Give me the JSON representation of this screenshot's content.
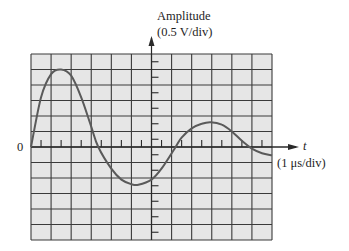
{
  "chart_data": {
    "type": "line",
    "title": "",
    "ylabel": "Amplitude",
    "ylabel_units": "(0.5 V/div)",
    "xlabel": "t",
    "xlabel_units": "(1 μs/div)",
    "origin_label": "0",
    "grid": true,
    "grid_divisions": {
      "x": 12,
      "y": 12
    },
    "x_per_div_us": 1,
    "y_per_div_V": 0.5,
    "xlim_us": [
      0,
      12
    ],
    "ylim_V": [
      -3,
      3
    ],
    "axis_position": {
      "y_axis_at_x_us": 6,
      "x_axis_at_y_V": 0
    },
    "series": [
      {
        "name": "waveform",
        "x_us": [
          0,
          0.5,
          1.0,
          1.5,
          2.0,
          2.5,
          3.0,
          3.35,
          4.0,
          4.5,
          5.0,
          5.35,
          6.0,
          6.5,
          7.2,
          7.5,
          8.0,
          8.5,
          8.95,
          9.5,
          10.0,
          10.5,
          11.0,
          11.5,
          12.0
        ],
        "y_V": [
          0,
          1.6,
          2.35,
          2.5,
          2.3,
          1.6,
          0.65,
          0,
          -0.7,
          -1.05,
          -1.2,
          -1.22,
          -1.05,
          -0.7,
          0,
          0.3,
          0.6,
          0.75,
          0.8,
          0.72,
          0.5,
          0.2,
          -0.05,
          -0.2,
          -0.27
        ]
      }
    ],
    "key_points": {
      "first_peak": {
        "t_us": 1.5,
        "V": 2.5
      },
      "trough": {
        "t_us": 5.35,
        "V": -1.2
      },
      "second_peak": {
        "t_us": 8.95,
        "V": 0.8
      },
      "zero_crossings_us": [
        0,
        3.35,
        7.2,
        11.0
      ]
    }
  },
  "labels": {
    "y_axis": "Amplitude",
    "y_units": "(0.5 V/div)",
    "x_axis": "t",
    "x_units": "(1 μs/div)",
    "origin": "0"
  },
  "colors": {
    "grid_fill": "#e6e6e6",
    "grid_line": "#3a3a3a",
    "axis": "#2a2a2a",
    "trace": "#5a5a5a"
  }
}
